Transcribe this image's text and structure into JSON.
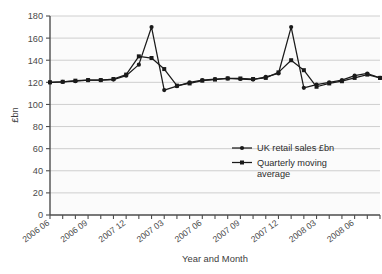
{
  "chart_data": {
    "type": "line",
    "title": "",
    "xlabel": "Year and Month",
    "ylabel": "£bn",
    "ylim": [
      0,
      180
    ],
    "ytick_step": 20,
    "yticks": [
      "0",
      "20",
      "40",
      "60",
      "80",
      "100",
      "120",
      "140",
      "160",
      "180"
    ],
    "grid": true,
    "legend_position": "inside-right",
    "x_tick_count": 27,
    "x_labeled_ticks": [
      {
        "index": 0,
        "label": "2006 06"
      },
      {
        "index": 3,
        "label": "2006 09"
      },
      {
        "index": 6,
        "label": "2007 12"
      },
      {
        "index": 9,
        "label": "2007 03"
      },
      {
        "index": 12,
        "label": "2007 06"
      },
      {
        "index": 15,
        "label": "2007 09"
      },
      {
        "index": 18,
        "label": "2007 12"
      },
      {
        "index": 21,
        "label": "2008 03"
      },
      {
        "index": 24,
        "label": "2008 06"
      }
    ],
    "x": [
      "2006 06",
      "2006 07",
      "2006 08",
      "2006 09",
      "2006 10",
      "2006 11",
      "2007 12",
      "2007 01",
      "2007 02",
      "2007 03",
      "2007 04",
      "2007 05",
      "2007 06",
      "2007 07",
      "2007 08",
      "2007 09",
      "2007 10",
      "2007 11",
      "2007 12",
      "2008 01",
      "2008 02",
      "2008 03",
      "2008 04",
      "2008 05",
      "2008 06",
      "2008 07",
      "2008 08"
    ],
    "series": [
      {
        "name": "UK retail sales £bn",
        "marker": "circle",
        "color": "#1a1a1a",
        "values": [
          120,
          120.5,
          121,
          122,
          122,
          122.5,
          126,
          136,
          170,
          113,
          116.5,
          120,
          122,
          123,
          123.5,
          123,
          122.5,
          125,
          128,
          170,
          115,
          118,
          120,
          122,
          126,
          128,
          124
        ]
      },
      {
        "name": "Quarterly moving average",
        "marker": "square",
        "color": "#1a1a1a",
        "values": [
          120,
          120.5,
          121.5,
          122,
          122,
          123,
          127,
          143.5,
          142,
          132,
          117,
          119,
          121.5,
          122.5,
          123.5,
          123.5,
          123,
          124,
          129,
          140,
          131,
          116,
          119,
          121,
          124,
          127,
          124
        ]
      }
    ],
    "legend": [
      {
        "label": "UK retail sales £bn",
        "marker": "circle"
      },
      {
        "label": "Quarterly moving average",
        "marker": "square"
      }
    ]
  },
  "colors": {
    "plot_background": "#fbfbfb",
    "grid": "#c9c9c9",
    "axis": "#4d4d4d",
    "series": "#1a1a1a",
    "text": "#3d3d3d"
  }
}
